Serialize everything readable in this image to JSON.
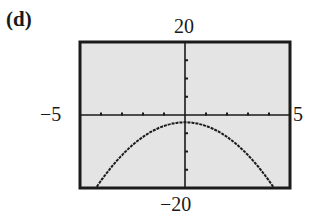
{
  "panel": {
    "label": "(d)"
  },
  "window": {
    "xmin_label": "−5",
    "xmax_label": "5",
    "ymin_label": "−20",
    "ymax_label": "20"
  },
  "chart_data": {
    "type": "line",
    "title": "(d)",
    "xlabel": "",
    "ylabel": "",
    "xlim": [
      -5,
      5
    ],
    "ylim": [
      -20,
      20
    ],
    "x_tick_step": 1,
    "y_tick_step": 5,
    "grid": false,
    "legend": null,
    "tick_labels": {
      "x": [
        "-5",
        "5"
      ],
      "y": [
        "-20",
        "20"
      ]
    },
    "series": [
      {
        "name": "curve",
        "description": "downward-opening parabola, vertex near (0, -2), approx y = -x^2 - 2",
        "x": [
          -4.2,
          -4,
          -3.5,
          -3,
          -2.5,
          -2,
          -1.5,
          -1,
          -0.5,
          0,
          0.5,
          1,
          1.5,
          2,
          2.5,
          3,
          3.5,
          4,
          4.2
        ],
        "y": [
          -19.6,
          -18,
          -14.25,
          -11,
          -8.25,
          -6,
          -4.25,
          -3,
          -2.25,
          -2,
          -2.25,
          -3,
          -4.25,
          -6,
          -8.25,
          -11,
          -14.25,
          -18,
          -19.6
        ]
      }
    ],
    "colors": {
      "background": "#e4e4e4",
      "frame": "#1a1a1a",
      "curve": "#1a1a1a"
    }
  }
}
